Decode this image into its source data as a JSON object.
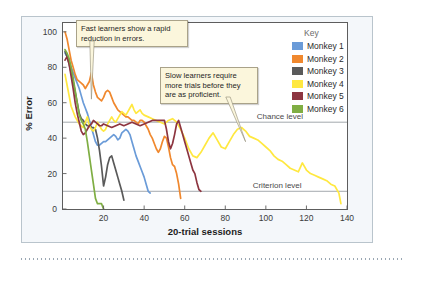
{
  "chart_data": {
    "type": "line",
    "title": "",
    "xlabel": "20-trial sessions",
    "ylabel": "% Error",
    "xlim": [
      0,
      140
    ],
    "ylim": [
      0,
      105
    ],
    "xticks": [
      20,
      40,
      60,
      80,
      100,
      120,
      140
    ],
    "yticks": [
      0,
      20,
      40,
      60,
      80,
      100
    ],
    "grid": false,
    "legend_position": "top-right-outside",
    "legend_title": "Key",
    "reference_lines": [
      {
        "name": "chance-level",
        "label": "Chance level",
        "y": 49,
        "color": "#8c9298"
      },
      {
        "name": "criterion-level",
        "label": "Criterion level",
        "y": 10,
        "color": "#8c9298"
      }
    ],
    "annotations": [
      {
        "name": "fast-learners-callout",
        "text": "Fast learners show a rapid reduction in errors.",
        "points_to_x": 14,
        "points_to_y": 62
      },
      {
        "name": "slow-learners-callout",
        "text": "Slow learners require more trials before they are as proficient.",
        "points_to_x": 90,
        "points_to_y": 38
      }
    ],
    "series": [
      {
        "name": "Monkey 1",
        "color": "#6a9bd8",
        "x": [
          1,
          2,
          3,
          4,
          5,
          6,
          7,
          8,
          9,
          10,
          11,
          12,
          13,
          14,
          15,
          16,
          17,
          18,
          19,
          20,
          21,
          22,
          23,
          24,
          25,
          26,
          27,
          28,
          29,
          30,
          31,
          32,
          33,
          34,
          35,
          36,
          37,
          38,
          39,
          40,
          41,
          42,
          43
        ],
        "values": [
          88,
          86,
          83,
          80,
          77,
          74,
          71,
          68,
          64,
          60,
          57,
          54,
          50,
          46,
          42,
          38,
          36,
          36,
          37,
          38,
          38,
          39,
          40,
          41,
          42,
          41,
          39,
          40,
          43,
          44,
          45,
          44,
          42,
          38,
          34,
          30,
          27,
          24,
          21,
          18,
          14,
          10,
          9
        ]
      },
      {
        "name": "Monkey 2",
        "color": "#f0882e",
        "x": [
          1,
          2,
          3,
          4,
          5,
          6,
          7,
          8,
          9,
          10,
          11,
          12,
          13,
          14,
          15,
          16,
          17,
          18,
          19,
          20,
          21,
          22,
          23,
          24,
          25,
          26,
          27,
          28,
          29,
          30,
          31,
          32,
          33,
          34,
          35,
          36,
          37,
          38,
          39,
          40,
          41,
          42,
          43,
          44,
          45,
          46,
          47,
          48,
          49,
          50,
          51,
          52,
          53,
          54,
          55,
          56,
          57,
          58
        ],
        "values": [
          100,
          96,
          90,
          84,
          80,
          76,
          73,
          72,
          71,
          70,
          68,
          70,
          72,
          77,
          70,
          66,
          63,
          62,
          61,
          63,
          66,
          67,
          66,
          63,
          60,
          58,
          56,
          55,
          54,
          53,
          52,
          52,
          51,
          50,
          50,
          49,
          48,
          50,
          50,
          49,
          47,
          45,
          42,
          40,
          37,
          34,
          32,
          34,
          38,
          41,
          40,
          35,
          29,
          25,
          24,
          20,
          14,
          6
        ]
      },
      {
        "name": "Monkey 3",
        "color": "#5a5a5a",
        "x": [
          1,
          2,
          3,
          4,
          5,
          6,
          7,
          8,
          9,
          10,
          11,
          12,
          13,
          14,
          15,
          16,
          17,
          18,
          19,
          20,
          21,
          22,
          23,
          24,
          25,
          26,
          27,
          28,
          29,
          30
        ],
        "values": [
          89,
          86,
          82,
          77,
          72,
          66,
          60,
          54,
          51,
          50,
          48,
          47,
          47,
          46,
          46,
          45,
          40,
          33,
          24,
          13,
          18,
          25,
          29,
          30,
          26,
          22,
          18,
          14,
          10,
          5
        ]
      },
      {
        "name": "Monkey 4",
        "color": "#ffe840",
        "x": [
          1,
          2,
          3,
          4,
          5,
          6,
          7,
          8,
          9,
          10,
          11,
          12,
          13,
          14,
          15,
          16,
          17,
          18,
          19,
          20,
          21,
          22,
          23,
          24,
          25,
          26,
          27,
          28,
          29,
          30,
          31,
          32,
          33,
          34,
          35,
          36,
          37,
          38,
          39,
          40,
          42,
          44,
          46,
          48,
          50,
          52,
          54,
          56,
          58,
          60,
          62,
          64,
          66,
          68,
          70,
          72,
          74,
          76,
          78,
          80,
          82,
          84,
          86,
          88,
          90,
          92,
          94,
          96,
          98,
          100,
          102,
          104,
          106,
          108,
          110,
          112,
          114,
          116,
          118,
          120,
          122,
          124,
          126,
          128,
          130,
          132,
          134,
          136,
          137
        ],
        "values": [
          76,
          70,
          64,
          58,
          55,
          52,
          50,
          48,
          47,
          46,
          49,
          52,
          47,
          45,
          44,
          46,
          49,
          47,
          45,
          44,
          45,
          48,
          50,
          52,
          50,
          49,
          51,
          53,
          55,
          54,
          53,
          55,
          57,
          59,
          56,
          54,
          55,
          56,
          54,
          53,
          52,
          51,
          50,
          49,
          48,
          50,
          51,
          49,
          45,
          40,
          34,
          30,
          29,
          32,
          36,
          40,
          43,
          39,
          35,
          34,
          38,
          42,
          45,
          46,
          44,
          41,
          40,
          39,
          37,
          35,
          33,
          30,
          28,
          27,
          25,
          23,
          22,
          21,
          26,
          22,
          20,
          19,
          18,
          17,
          16,
          14,
          13,
          9,
          3
        ]
      },
      {
        "name": "Monkey 5",
        "color": "#8d3540",
        "x": [
          1,
          2,
          3,
          4,
          5,
          6,
          7,
          8,
          9,
          10,
          11,
          12,
          13,
          14,
          15,
          16,
          17,
          18,
          19,
          20,
          22,
          24,
          26,
          28,
          30,
          32,
          34,
          36,
          38,
          40,
          42,
          44,
          46,
          48,
          50,
          51,
          52,
          53,
          54,
          55,
          56,
          57,
          58,
          59,
          60,
          61,
          62,
          63,
          64,
          65,
          66,
          67,
          68
        ],
        "values": [
          84,
          86,
          82,
          75,
          68,
          60,
          54,
          49,
          44,
          42,
          43,
          45,
          47,
          48,
          50,
          49,
          48,
          47,
          47,
          48,
          47,
          46,
          47,
          48,
          47,
          48,
          49,
          48,
          47,
          48,
          49,
          50,
          50,
          50,
          50,
          45,
          38,
          34,
          37,
          42,
          48,
          50,
          46,
          42,
          38,
          34,
          30,
          26,
          22,
          20,
          15,
          11,
          10
        ]
      },
      {
        "name": "Monkey 6",
        "color": "#7fae43",
        "x": [
          1,
          2,
          3,
          4,
          5,
          6,
          7,
          8,
          9,
          10,
          11,
          12,
          13,
          14,
          15,
          16,
          17,
          18,
          19,
          20
        ],
        "values": [
          90,
          88,
          85,
          80,
          74,
          67,
          60,
          53,
          50,
          48,
          45,
          38,
          30,
          22,
          14,
          6,
          3,
          3,
          3,
          0
        ]
      }
    ]
  },
  "legend": {
    "title": "Key",
    "items": [
      {
        "label": "Monkey 1",
        "color": "#6a9bd8"
      },
      {
        "label": "Monkey 2",
        "color": "#f0882e"
      },
      {
        "label": "Monkey 3",
        "color": "#5a5a5a"
      },
      {
        "label": "Monkey 4",
        "color": "#ffe840"
      },
      {
        "label": "Monkey 5",
        "color": "#8d3540"
      },
      {
        "label": "Monkey 6",
        "color": "#7fae43"
      }
    ]
  },
  "axes": {
    "y_title": "% Error",
    "x_title": "20-trial sessions",
    "y_ticks": [
      "0",
      "20",
      "40",
      "60",
      "80",
      "100"
    ],
    "x_ticks": [
      "20",
      "40",
      "60",
      "80",
      "100",
      "120",
      "140"
    ]
  },
  "callouts": {
    "fast": "Fast learners show a rapid reduction in errors.",
    "slow": "Slow learners require more trials before they are as proficient."
  },
  "reference_labels": {
    "chance": "Chance level",
    "criterion": "Criterion level"
  }
}
